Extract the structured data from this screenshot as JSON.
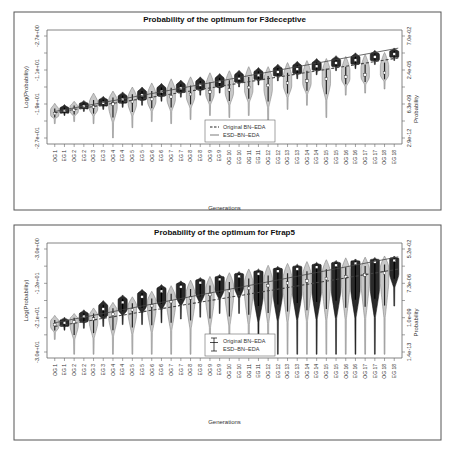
{
  "colors": {
    "background": "#ffffff",
    "frame": "#555555",
    "axis": "#666666",
    "text": "#333333",
    "og_fill": "#c8c8c8",
    "og_stroke": "#777777",
    "eg_fill": "#2a2a2a",
    "eg_stroke": "#111111",
    "median_dot": "#ffffff",
    "fit_line": "#444444"
  },
  "chart_data": [
    {
      "type": "violin",
      "title": "Probability of the optimum for F3deceptive",
      "xlabel": "Generations",
      "ylabel": "Log(Probability)",
      "ylabel_right": "Probability",
      "yticks_left": [
        "-2.7e+01",
        "-1.9e+01",
        "-1.1e+01",
        "-2.7e+00"
      ],
      "yticks_right": [
        "2.9e-12",
        "6.3e-09",
        "2.4e-05",
        "7.0e-02"
      ],
      "ylim": [
        -28,
        0
      ],
      "left_tick_values": [
        -27,
        -19,
        -11,
        -2.7
      ],
      "categories": [
        "OG 1",
        "EG 1",
        "OG 2",
        "EG 2",
        "OG 3",
        "EG 3",
        "OG 4",
        "EG 4",
        "OG 5",
        "EG 5",
        "OG 6",
        "EG 6",
        "OG 7",
        "EG 7",
        "OG 8",
        "EG 8",
        "OG 9",
        "EG 9",
        "OG 10",
        "EG 10",
        "OG 11",
        "EG 11",
        "OG 12",
        "EG 12",
        "OG 13",
        "EG 13",
        "OG 14",
        "EG 14",
        "OG 15",
        "EG 15",
        "OG 16",
        "EG 16",
        "OG 17",
        "EG 17",
        "OG 18",
        "EG 18"
      ],
      "series": [
        {
          "name": "Original BN-EDA (OG)",
          "medians": [
            -20.5,
            -19.6,
            -18.9,
            -18.2,
            -17.6,
            -17.0,
            -16.4,
            -15.8,
            -15.2,
            -14.7,
            -14.1,
            -13.6,
            -13.0,
            -12.5,
            -12.0,
            -11.5,
            -11.0,
            -10.5
          ],
          "upper": [
            -18.0,
            -17.5,
            -15.5,
            -15.0,
            -14.0,
            -13.0,
            -12.0,
            -11.5,
            -10.5,
            -10.0,
            -9.0,
            -9.0,
            -8.0,
            -7.5,
            -7.0,
            -6.5,
            -6.0,
            -5.5
          ],
          "lower": [
            -23.0,
            -22.5,
            -23.0,
            -26.5,
            -24.0,
            -22.5,
            -23.0,
            -22.0,
            -21.0,
            -21.5,
            -21.0,
            -23.5,
            -19.5,
            -18.5,
            -21.5,
            -16.0,
            -15.5,
            -14.5
          ]
        },
        {
          "name": "ESD-BN-EDA (EG)",
          "medians": [
            -19.8,
            -18.7,
            -17.9,
            -17.0,
            -16.0,
            -15.1,
            -14.3,
            -13.5,
            -12.7,
            -11.9,
            -11.1,
            -10.3,
            -9.6,
            -8.9,
            -8.1,
            -7.4,
            -6.6,
            -5.9
          ],
          "upper": [
            -18.3,
            -17.3,
            -16.3,
            -15.2,
            -14.0,
            -13.1,
            -12.3,
            -11.5,
            -10.7,
            -9.9,
            -9.2,
            -8.4,
            -7.7,
            -7.0,
            -6.3,
            -5.6,
            -5.0,
            -4.4
          ],
          "lower": [
            -21.0,
            -20.0,
            -19.5,
            -19.0,
            -18.5,
            -17.5,
            -16.5,
            -16.0,
            -15.5,
            -14.0,
            -13.5,
            -12.5,
            -12.0,
            -11.0,
            -10.0,
            -9.5,
            -8.5,
            -7.5
          ]
        }
      ],
      "fit_lines": [
        {
          "name": "Original BN-EDA",
          "style": "dashed",
          "start": [
            0,
            -20.3
          ],
          "end": [
            35,
            -7.0
          ]
        },
        {
          "name": "ESD-BN-EDA",
          "style": "solid",
          "start": [
            0,
            -20.0
          ],
          "end": [
            35,
            -4.6
          ]
        }
      ],
      "legend": {
        "position": "lower-middle",
        "entries": [
          {
            "label": "Original BN–EDA",
            "line": "dashed"
          },
          {
            "label": "ESD–BN–EDA",
            "line": "solid"
          }
        ]
      },
      "grid": false
    },
    {
      "type": "violin",
      "title": "Probability of the optimum for Ftrap5",
      "xlabel": "Generations",
      "ylabel": "Log(Probability)",
      "ylabel_right": "Probability",
      "yticks_left": [
        "-3.0e+01",
        "-2.1e+01",
        "-1.2e+01",
        "-3.0e+00"
      ],
      "yticks_right": [
        "1.4e-13",
        "1.0e-09",
        "7.3e-06",
        "5.2e-02"
      ],
      "ylim": [
        -31,
        0
      ],
      "left_tick_values": [
        -30,
        -21,
        -12,
        -3
      ],
      "categories": [
        "OG 1",
        "EG 1",
        "OG 2",
        "EG 2",
        "OG 3",
        "EG 3",
        "OG 4",
        "EG 4",
        "OG 5",
        "EG 5",
        "OG 6",
        "EG 6",
        "OG 7",
        "EG 7",
        "OG 8",
        "EG 8",
        "OG 9",
        "EG 9",
        "OG 10",
        "EG 10",
        "OG 11",
        "EG 11",
        "OG 12",
        "EG 12",
        "OG 13",
        "EG 13",
        "OG 14",
        "EG 14",
        "OG 15",
        "EG 15",
        "OG 16",
        "EG 16",
        "OG 17",
        "EG 17",
        "OG 18",
        "EG 18"
      ],
      "series": [
        {
          "name": "Original BN-EDA (OG)",
          "medians": [
            -22.0,
            -21.3,
            -20.5,
            -19.2,
            -18.0,
            -16.9,
            -15.8,
            -14.8,
            -13.9,
            -13.0,
            -12.2,
            -11.5,
            -10.8,
            -10.2,
            -9.6,
            -9.1,
            -8.6,
            -8.1
          ],
          "upper": [
            -19.5,
            -19.0,
            -17.5,
            -16.0,
            -14.5,
            -13.0,
            -11.5,
            -10.0,
            -9.0,
            -8.0,
            -7.0,
            -6.0,
            -5.5,
            -5.0,
            -4.5,
            -4.0,
            -3.8,
            -3.5
          ],
          "lower": [
            -26.0,
            -30.0,
            -30.0,
            -30.0,
            -30.0,
            -30.0,
            -30.0,
            -30.0,
            -30.0,
            -30.0,
            -30.0,
            -30.0,
            -30.0,
            -30.0,
            -30.0,
            -30.0,
            -30.0,
            -30.0
          ]
        },
        {
          "name": "ESD-BN-EDA (EG)",
          "medians": [
            -21.5,
            -19.8,
            -17.8,
            -16.0,
            -14.5,
            -13.0,
            -11.8,
            -10.7,
            -9.8,
            -9.0,
            -8.3,
            -7.6,
            -7.0,
            -6.5,
            -6.0,
            -5.5,
            -5.1,
            -4.7
          ],
          "upper": [
            -20.0,
            -18.0,
            -15.5,
            -14.0,
            -12.5,
            -11.2,
            -10.2,
            -9.3,
            -8.5,
            -7.7,
            -7.0,
            -6.3,
            -5.7,
            -5.2,
            -4.7,
            -4.3,
            -3.9,
            -3.5
          ],
          "lower": [
            -23.5,
            -23.0,
            -22.5,
            -22.0,
            -22.0,
            -21.5,
            -20.5,
            -20.0,
            -19.0,
            -19.0,
            -30.0,
            -30.0,
            -30.0,
            -30.0,
            -30.0,
            -30.0,
            -30.0,
            -17.0
          ]
        }
      ],
      "fit_lines": [
        {
          "name": "Original BN-EDA",
          "style": "dashed",
          "start": [
            0,
            -22.5
          ],
          "end": [
            35,
            -7.2
          ]
        },
        {
          "name": "ESD-BN-EDA",
          "style": "solid",
          "start": [
            0,
            -21.5
          ],
          "end": [
            35,
            -3.9
          ]
        }
      ],
      "legend": {
        "position": "lower-middle",
        "entries": [
          {
            "label": "Original BN–EDA",
            "line": "errorbar"
          },
          {
            "label": "ESD–BN–EDA",
            "line": "errorbar"
          }
        ]
      },
      "grid": false
    }
  ],
  "panels": [
    {
      "frame": {
        "x": 14,
        "y": 12,
        "w": 427,
        "h": 198
      },
      "plot": {
        "x": 47,
        "y": 30,
        "w": 355,
        "h": 114
      },
      "title_y": 22,
      "xtick_label_y": 150,
      "xlabel_y": 210
    },
    {
      "frame": {
        "x": 14,
        "y": 225,
        "w": 427,
        "h": 215
      },
      "plot": {
        "x": 47,
        "y": 243,
        "w": 355,
        "h": 115
      },
      "title_y": 235,
      "xtick_label_y": 364,
      "xlabel_y": 424
    }
  ]
}
